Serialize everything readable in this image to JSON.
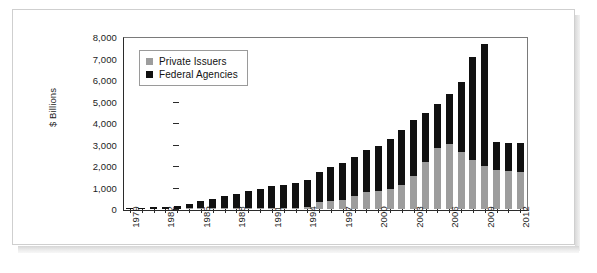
{
  "chart_data": {
    "type": "bar",
    "stacked": true,
    "title": "",
    "subtitle": "",
    "xlabel": "",
    "ylabel": "$ Billions",
    "ylim": [
      0,
      8000
    ],
    "ytick_labels": [
      "8,000",
      "7,000",
      "6,000",
      "5,000",
      "4,000",
      "3,000",
      "2,000",
      "1,000",
      "0"
    ],
    "ytick_values": [
      8000,
      7000,
      6000,
      5000,
      4000,
      3000,
      2000,
      1000,
      0
    ],
    "grid": false,
    "legend_position": "top-left",
    "categories": [
      "1979",
      "1980",
      "1981",
      "1982",
      "1983",
      "1984",
      "1985",
      "1986",
      "1987",
      "1988",
      "1989",
      "1990",
      "1991",
      "1992",
      "1993",
      "1994",
      "1995",
      "1996",
      "1997",
      "1998",
      "1999",
      "2000",
      "2001",
      "2002",
      "2003",
      "2004",
      "2005",
      "2006",
      "2007",
      "2008",
      "2009",
      "2010",
      "2011",
      "2012"
    ],
    "xtick_labels_shown": [
      "1979",
      "1982",
      "1985",
      "1988",
      "1991",
      "1994",
      "1997",
      "2000",
      "2003",
      "2006",
      "2009",
      "2012"
    ],
    "series": [
      {
        "name": "Private Issuers",
        "color": "#9d9d9d",
        "values": [
          0,
          0,
          0,
          0,
          0,
          5,
          10,
          15,
          20,
          25,
          30,
          40,
          50,
          60,
          70,
          80,
          310,
          380,
          440,
          620,
          780,
          860,
          950,
          1120,
          1520,
          2210,
          2830,
          3030,
          2670,
          2280,
          2000,
          1800,
          1760,
          1740
        ]
      },
      {
        "name": "Federal Agencies",
        "color": "#111111",
        "values": [
          60,
          70,
          90,
          110,
          150,
          215,
          325,
          450,
          580,
          680,
          790,
          900,
          1000,
          1080,
          1150,
          1250,
          1390,
          1570,
          1720,
          1790,
          1970,
          2080,
          2290,
          2550,
          2600,
          2260,
          2050,
          2330,
          3240,
          4780,
          5660,
          1330,
          1320,
          1320
        ]
      }
    ],
    "totals": [
      60,
      70,
      90,
      110,
      150,
      220,
      335,
      465,
      600,
      705,
      820,
      940,
      1050,
      1140,
      1220,
      1330,
      1700,
      1950,
      2160,
      2410,
      2750,
      2940,
      3240,
      3670,
      4120,
      4470,
      4880,
      5360,
      5910,
      7060,
      7660,
      3130,
      3080,
      3060
    ]
  },
  "legend": {
    "items": [
      {
        "label": "Private Issuers",
        "swatch": "gray-square"
      },
      {
        "label": "Federal Agencies",
        "swatch": "black-square"
      }
    ]
  }
}
